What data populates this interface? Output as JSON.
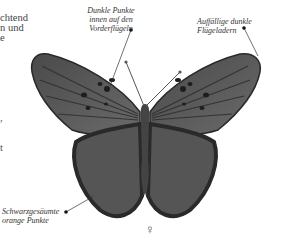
{
  "body_text": {
    "lines": [
      "chtend",
      "n und",
      "e"
    ],
    "fragments": [
      ",",
      "t"
    ]
  },
  "labels": {
    "dark_spots": [
      "Dunkle Punkte",
      "innen auf den",
      "Vorderflügeln"
    ],
    "dark_veins": [
      "Auffällige dunkle",
      "Flügeladern"
    ],
    "bordered_spots": [
      "Schwarzgesäumte",
      "orange Punkte"
    ]
  },
  "symbol": "♀",
  "colors": {
    "wing": "#5a5a5a",
    "wing_dark": "#2a2a2a",
    "text": "#333333"
  }
}
